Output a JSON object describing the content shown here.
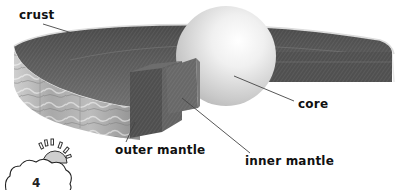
{
  "diagram": {
    "labels": {
      "crust": "crust",
      "core": "core",
      "outer_mantle": "outer mantle",
      "inner_mantle": "inner mantle"
    },
    "colors": {
      "background": "#ffffff",
      "disc_top": "#5e5e5e",
      "disc_rim": "#d8d8d8",
      "core_sphere": "#e6e6e6",
      "outer_mantle_block": "#555555",
      "inner_mantle_block": "#6a6a6a",
      "leader_line": "#444444",
      "label_text": "#111111"
    }
  },
  "page_badge": {
    "icon": "cloud-sun-icon",
    "number": "4"
  }
}
